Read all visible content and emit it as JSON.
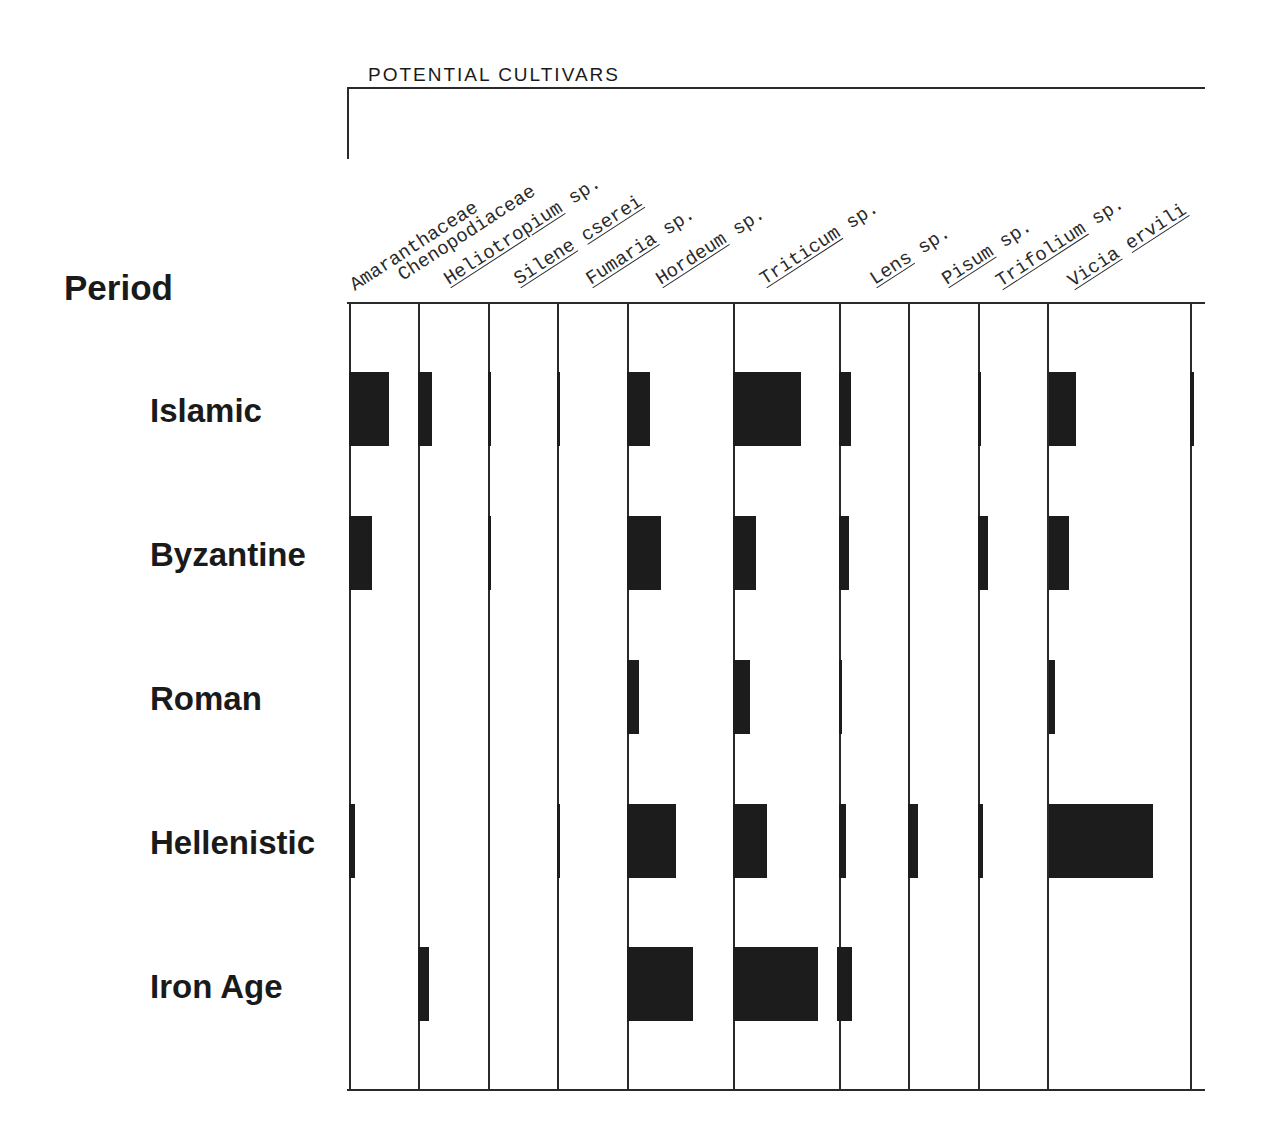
{
  "chart_data": {
    "type": "table",
    "title": "POTENTIAL CULTIVARS",
    "ylabel": "Period",
    "xlabel": "",
    "categories": [
      "Islamic",
      "Byzantine",
      "Roman",
      "Hellenistic",
      "Iron Age"
    ],
    "columns": [
      {
        "label": "Amaranthaceae",
        "genus": "Amaranthaceae",
        "suffix": "",
        "underline": false
      },
      {
        "label": "Chenopodiaceae",
        "genus": "Chenopodiaceae",
        "suffix": "",
        "underline": false
      },
      {
        "label": "Heliotropium sp.",
        "genus": "Heliotropium",
        "suffix": " sp.",
        "underline": true
      },
      {
        "label": "Silene cserei",
        "genus": "Silene",
        "suffix": " cserei",
        "underline": true
      },
      {
        "label": "Fumaria sp.",
        "genus": "Fumaria",
        "suffix": " sp.",
        "underline": true
      },
      {
        "label": "Hordeum sp.",
        "genus": "Hordeum",
        "suffix": " sp.",
        "underline": true
      },
      {
        "label": "Triticum sp.",
        "genus": "Triticum",
        "suffix": " sp.",
        "underline": true
      },
      {
        "label": "Lens sp.",
        "genus": "Lens",
        "suffix": " sp.",
        "underline": true
      },
      {
        "label": "Pisum sp.",
        "genus": "Pisum",
        "suffix": " sp.",
        "underline": true
      },
      {
        "label": "Trifolium sp.",
        "genus": "Trifolium",
        "suffix": " sp.",
        "underline": true
      },
      {
        "label": "Vicia ervilia",
        "genus": "Vicia",
        "suffix": " ervili",
        "underline": true
      }
    ],
    "column_x": [
      349,
      418,
      488,
      557,
      627,
      627,
      733,
      839,
      908,
      978,
      1047,
      1190
    ],
    "series_note": "Bar width indicates relative abundance (px width of filled bar, relative units)",
    "series": [
      {
        "name": "Islamic",
        "values": {
          "Amaranthaceae": 40,
          "Chenopodiaceae": 14,
          "Heliotropium sp.": 3,
          "Silene cserei": 3,
          "Hordeum sp.": 23,
          "Triticum sp.": 68,
          "Lens sp.": 12,
          "Trifolium sp.": 3,
          "Vicia ervilia": 27,
          "(unlabeled, right edge)": 4
        }
      },
      {
        "name": "Byzantine",
        "values": {
          "Amaranthaceae": 23,
          "Heliotropium sp.": 3,
          "Hordeum sp.": 34,
          "Triticum sp.": 23,
          "Lens sp.": 10,
          "Trifolium sp.": 10,
          "Vicia ervilia": 20
        }
      },
      {
        "name": "Roman",
        "values": {
          "Hordeum sp.": 12,
          "Triticum sp.": 17,
          "Lens sp.": 3,
          "Vicia ervilia": 6
        }
      },
      {
        "name": "Hellenistic",
        "values": {
          "Amaranthaceae": 6,
          "Silene cserei": 3,
          "Hordeum sp.": 49,
          "Triticum sp.": 34,
          "Lens sp.": 7,
          "Pisum sp.": 10,
          "Trifolium sp.": 5,
          "Vicia ervilia": 104
        }
      },
      {
        "name": "Iron Age",
        "values": {
          "Chenopodiaceae": 11,
          "Hordeum sp.": 66,
          "Triticum sp.": 85,
          "Lens sp.": 15
        }
      }
    ],
    "bars": [
      {
        "period": 0,
        "x": 349,
        "w": 40
      },
      {
        "period": 0,
        "x": 418,
        "w": 14
      },
      {
        "period": 0,
        "x": 488,
        "w": 3
      },
      {
        "period": 0,
        "x": 557,
        "w": 3
      },
      {
        "period": 0,
        "x": 627,
        "w": 23
      },
      {
        "period": 0,
        "x": 733,
        "w": 68
      },
      {
        "period": 0,
        "x": 839,
        "w": 12
      },
      {
        "period": 0,
        "x": 978,
        "w": 3
      },
      {
        "period": 0,
        "x": 1049,
        "w": 27
      },
      {
        "period": 0,
        "x": 1190,
        "w": 4
      },
      {
        "period": 1,
        "x": 349,
        "w": 23
      },
      {
        "period": 1,
        "x": 488,
        "w": 3
      },
      {
        "period": 1,
        "x": 627,
        "w": 34
      },
      {
        "period": 1,
        "x": 733,
        "w": 23
      },
      {
        "period": 1,
        "x": 839,
        "w": 10
      },
      {
        "period": 1,
        "x": 978,
        "w": 10
      },
      {
        "period": 1,
        "x": 1049,
        "w": 20
      },
      {
        "period": 2,
        "x": 627,
        "w": 12
      },
      {
        "period": 2,
        "x": 733,
        "w": 17
      },
      {
        "period": 2,
        "x": 839,
        "w": 3
      },
      {
        "period": 2,
        "x": 1049,
        "w": 6
      },
      {
        "period": 3,
        "x": 349,
        "w": 6
      },
      {
        "period": 3,
        "x": 557,
        "w": 3
      },
      {
        "period": 3,
        "x": 627,
        "w": 49
      },
      {
        "period": 3,
        "x": 733,
        "w": 34
      },
      {
        "period": 3,
        "x": 839,
        "w": 7
      },
      {
        "period": 3,
        "x": 908,
        "w": 10
      },
      {
        "period": 3,
        "x": 978,
        "w": 5
      },
      {
        "period": 3,
        "x": 1049,
        "w": 104
      },
      {
        "period": 4,
        "x": 418,
        "w": 11
      },
      {
        "period": 4,
        "x": 627,
        "w": 66
      },
      {
        "period": 4,
        "x": 733,
        "w": 85
      },
      {
        "period": 4,
        "x": 837,
        "w": 15
      }
    ],
    "row_y": [
      372,
      516,
      660,
      804,
      947
    ],
    "row_h": 74,
    "grid": true,
    "legend": null
  },
  "header": {
    "title": "POTENTIAL CULTIVARS"
  },
  "axis": {
    "period_heading": "Period"
  },
  "periods": [
    "Islamic",
    "Byzantine",
    "Roman",
    "Hellenistic",
    "Iron Age"
  ],
  "colors": {
    "bar": "#1c1c1c",
    "line": "#2a2a2a",
    "background": "#ffffff"
  }
}
